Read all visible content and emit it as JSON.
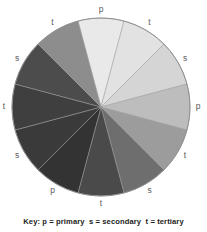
{
  "figure": {
    "name": "colour-wheel-diagram",
    "background_color": "#ffffff"
  },
  "wheel": {
    "center_x": 101,
    "center_y": 107,
    "radius": 89,
    "outline_color": "#8e8e8e",
    "divider_color": "#9a9a9a",
    "segment_count": 12,
    "segments": [
      {
        "index": 0,
        "label": "p",
        "category": "primary",
        "start_angle": -15,
        "end_angle": 15,
        "color": "#e9e9e9",
        "label_angle": 0,
        "label_radius": 97
      },
      {
        "index": 1,
        "label": "t",
        "category": "tertiary",
        "start_angle": 15,
        "end_angle": 45,
        "color": "#e2e2e2",
        "label_angle": 30,
        "label_radius": 97
      },
      {
        "index": 2,
        "label": "s",
        "category": "secondary",
        "start_angle": 45,
        "end_angle": 75,
        "color": "#d5d5d5",
        "label_angle": 60,
        "label_radius": 97
      },
      {
        "index": 3,
        "label": "p",
        "category": "primary",
        "start_angle": 75,
        "end_angle": 105,
        "color": "#bdbdbd",
        "label_angle": 90,
        "label_radius": 97
      },
      {
        "index": 4,
        "label": "t",
        "category": "tertiary",
        "start_angle": 105,
        "end_angle": 135,
        "color": "#9c9c9c",
        "label_angle": 120,
        "label_radius": 97
      },
      {
        "index": 5,
        "label": "s",
        "category": "secondary",
        "start_angle": 135,
        "end_angle": 165,
        "color": "#6e6e6e",
        "label_angle": 150,
        "label_radius": 97
      },
      {
        "index": 6,
        "label": "t",
        "category": "tertiary",
        "start_angle": 165,
        "end_angle": 195,
        "color": "#4a4a4a",
        "label_angle": 180,
        "label_radius": 97
      },
      {
        "index": 7,
        "label": "p",
        "category": "primary",
        "start_angle": 195,
        "end_angle": 225,
        "color": "#333333",
        "label_angle": 210,
        "label_radius": 97
      },
      {
        "index": 8,
        "label": "s",
        "category": "secondary",
        "start_angle": 225,
        "end_angle": 255,
        "color": "#3a3a3a",
        "label_angle": 240,
        "label_radius": 97
      },
      {
        "index": 9,
        "label": "t",
        "category": "tertiary",
        "start_angle": 255,
        "end_angle": 285,
        "color": "#3f3f3f",
        "label_angle": 270,
        "label_radius": 97
      },
      {
        "index": 10,
        "label": "s",
        "category": "secondary",
        "start_angle": 285,
        "end_angle": 315,
        "color": "#4c4c4c",
        "label_angle": 300,
        "label_radius": 97
      },
      {
        "index": 11,
        "label": "t",
        "category": "tertiary",
        "start_angle": 315,
        "end_angle": 345,
        "color": "#8d8d8d",
        "label_angle": 330,
        "label_radius": 97
      }
    ]
  },
  "key": {
    "text": "Key: p = primary  s = secondary  t = tertiary",
    "prefix": "Key:",
    "entries": [
      {
        "symbol": "p",
        "meaning": "primary"
      },
      {
        "symbol": "s",
        "meaning": "secondary"
      },
      {
        "symbol": "t",
        "meaning": "tertiary"
      }
    ]
  }
}
